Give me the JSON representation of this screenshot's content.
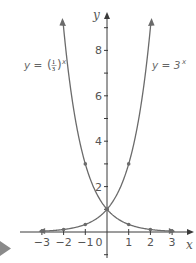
{
  "chart_data": {
    "type": "line",
    "title": "",
    "xlabel": "x",
    "ylabel": "y",
    "xlim": [
      -3.5,
      3.5
    ],
    "ylim": [
      -1,
      9.5
    ],
    "x_ticks": [
      -3,
      -2,
      -1,
      0,
      1,
      2,
      3
    ],
    "x_tick_labels": [
      "−3",
      "−2",
      "−1",
      "0",
      "1",
      "2",
      "3"
    ],
    "y_ticks": [
      -1,
      1,
      2,
      3,
      4,
      5,
      6,
      7,
      8,
      9
    ],
    "y_tick_labels": {
      "2": "2",
      "4": "4",
      "6": "6",
      "8": "8"
    },
    "grid": false,
    "series": [
      {
        "name": "y = 3^x",
        "label_text": "y = 3",
        "label_sup": "x",
        "points": [
          [
            -3,
            0.037
          ],
          [
            -2,
            0.111
          ],
          [
            -1,
            0.333
          ],
          [
            0,
            1
          ],
          [
            1,
            3
          ],
          [
            2,
            9
          ]
        ],
        "marked_points": [
          [
            -3,
            0.037
          ],
          [
            -2,
            0.111
          ],
          [
            -1,
            0.333
          ],
          [
            0,
            1
          ],
          [
            1,
            3
          ]
        ],
        "color": "#6b6b6b"
      },
      {
        "name": "y = (1/3)^x",
        "label_text": "y = ",
        "label_frac_num": "1",
        "label_frac_den": "3",
        "label_sup": "x",
        "points": [
          [
            -2,
            9
          ],
          [
            -1,
            3
          ],
          [
            0,
            1
          ],
          [
            1,
            0.333
          ],
          [
            2,
            0.111
          ],
          [
            3,
            0.037
          ]
        ],
        "marked_points": [
          [
            -1,
            3
          ],
          [
            0,
            1
          ],
          [
            1,
            0.333
          ],
          [
            2,
            0.111
          ],
          [
            3,
            0.037
          ]
        ],
        "color": "#6b6b6b"
      }
    ],
    "annotations": [
      "y = (1/3)^x",
      "y = 3^x"
    ]
  },
  "layout": {
    "origin_px": [
      107,
      232
    ],
    "x_unit_px": 21.7,
    "y_unit_px": 22.7,
    "axis_color": "#3a3a3a",
    "curve_color": "#6b6b6b",
    "marker_color": "#8a8a8a"
  },
  "labels": {
    "y_axis": "y",
    "x_axis": "x",
    "eq_left_prefix": "y = ",
    "eq_left_num": "1",
    "eq_left_den": "3",
    "eq_left_sup": "x",
    "eq_right_prefix": "y = 3",
    "eq_right_sup": "x"
  }
}
